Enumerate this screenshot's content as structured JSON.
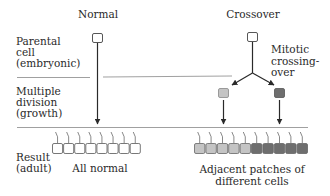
{
  "columns": {
    "normal": "Normal",
    "crossover": "Crossover"
  },
  "stages": {
    "parental_line1": "Parental",
    "parental_line2": "cell",
    "parental_line3": "(embryonic)",
    "division_line1": "Multiple",
    "division_line2": "division",
    "division_line3": "(growth)",
    "result_line1": "Result",
    "result_line2": "(adult)"
  },
  "annotations": {
    "mitotic_line1": "Mitotic",
    "mitotic_line2": "crossing-",
    "mitotic_line3": "over",
    "all_normal": "All normal",
    "patches_line1": "Adjacent patches of",
    "patches_line2": "different cells"
  },
  "cells": {
    "normal_count": 8,
    "patch_light_count": 5,
    "patch_dark_count": 5
  },
  "colors": {
    "line": "#2a2a2a",
    "divider": "#888888",
    "normal_cell": "#ffffff",
    "light_cell": "#c4c4c4",
    "dark_cell": "#6e6e6e"
  }
}
